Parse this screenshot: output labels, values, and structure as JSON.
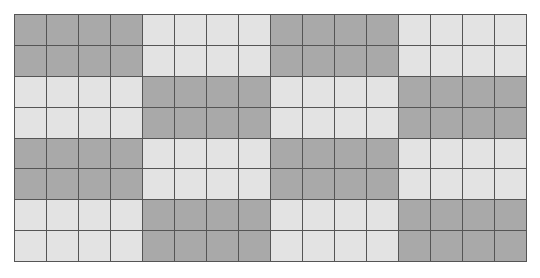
{
  "grid": {
    "columns": 16,
    "rows": 8,
    "block_width": 4,
    "block_height": 2,
    "pattern": "checkerboard of 4x2 blocks, top-left block dark",
    "colors": {
      "dark": "#a9a9a9",
      "light": "#e3e3e3",
      "line": "#555555"
    },
    "block_rows": [
      [
        "dark",
        "light",
        "dark",
        "light"
      ],
      [
        "light",
        "dark",
        "light",
        "dark"
      ],
      [
        "dark",
        "light",
        "dark",
        "light"
      ],
      [
        "light",
        "dark",
        "light",
        "dark"
      ]
    ]
  }
}
